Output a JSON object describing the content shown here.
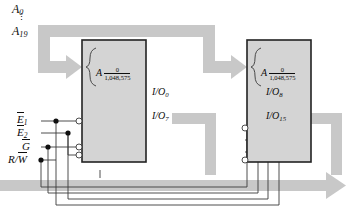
{
  "diagram": {
    "colors": {
      "bus": "#c8c8c8",
      "bus_edge": "#b4b4b4",
      "chip_fill": "#d4d4d4",
      "chip_border": "#222222",
      "wire": "#3a3a3a",
      "text": "#0d0d0d",
      "background": "#ffffff"
    }
  },
  "address_bus": {
    "top_label": "A",
    "top_sub": "0",
    "bottom_label": "A",
    "bottom_sub": "19",
    "dots": "⋮",
    "name": "address-bus"
  },
  "control_signals": [
    {
      "label": "E",
      "sub": "1",
      "overline": true,
      "name": "enable-1"
    },
    {
      "label": "E",
      "sub": "2",
      "overline": true,
      "name": "enable-2"
    },
    {
      "label": "G",
      "sub": "",
      "overline": true,
      "name": "output-enable"
    },
    {
      "label": "R/W",
      "sub": "",
      "overline": "partial",
      "name": "read-write"
    }
  ],
  "chips": [
    {
      "name": "memory-chip-left",
      "addr_symbol": "A",
      "range_top": "0",
      "range_bottom": "1,048,575",
      "io_top": "I/O",
      "io_top_sub": "0",
      "io_bottom": "I/O",
      "io_bottom_sub": "7"
    },
    {
      "name": "memory-chip-right",
      "addr_symbol": "A",
      "range_top": "0",
      "range_bottom": "1,048,575",
      "io_top": "I/O",
      "io_top_sub": "8",
      "io_bottom": "I/O",
      "io_bottom_sub": "15"
    }
  ]
}
